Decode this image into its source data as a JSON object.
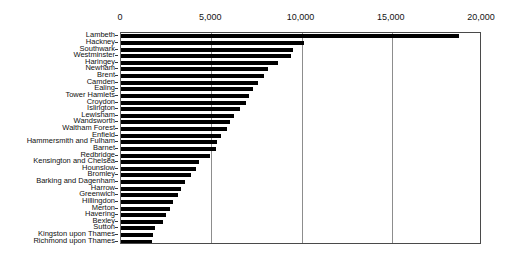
{
  "chart_data": {
    "type": "bar",
    "orientation": "horizontal",
    "title": "",
    "subtitle": "",
    "xlabel": "",
    "ylabel": "",
    "xlim": [
      0,
      20000
    ],
    "ylim": null,
    "grid": true,
    "grid_axis": "x",
    "legend": false,
    "legend_position": "none",
    "bar_color": "#000000",
    "frame_color": "#4a4a4a",
    "gridline_color": "#8d8d8d",
    "x_ticks": [
      0,
      5000,
      10000,
      15000,
      20000
    ],
    "x_tick_labels": [
      "0",
      "5,000",
      "10,000",
      "15,000",
      "20,000"
    ],
    "categories": [
      "Lambeth",
      "Hackney",
      "Southwark",
      "Westminster",
      "Haringey",
      "Newham",
      "Brent",
      "Camden",
      "Ealing",
      "Tower Hamlets",
      "Croydon",
      "Islington",
      "Lewisham",
      "Wandsworth",
      "Waltham Forest",
      "Enfield",
      "Hammersmith and Fulham",
      "Barnet",
      "Redbridge",
      "Kensington and Chelsea",
      "Hounslow",
      "Bromley",
      "Barking and Dagenham",
      "Harrow",
      "Greenwich",
      "Hillingdon",
      "Merton",
      "Havering",
      "Bexley",
      "Sutton",
      "Kingston upon Thames",
      "Richmond upon Thames"
    ],
    "values": [
      18700,
      10150,
      9550,
      9400,
      8700,
      8150,
      7900,
      7600,
      7300,
      7100,
      6900,
      6600,
      6250,
      6050,
      5900,
      5550,
      5300,
      5250,
      4950,
      4300,
      4150,
      3900,
      3550,
      3300,
      3150,
      2900,
      2700,
      2500,
      2300,
      1900,
      1750,
      1700
    ]
  }
}
